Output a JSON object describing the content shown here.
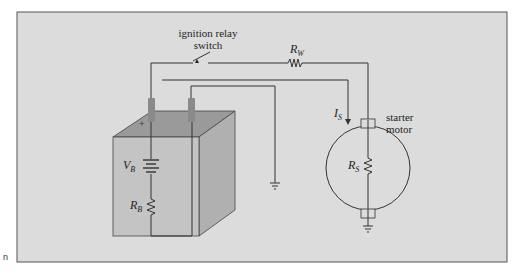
{
  "figure": {
    "background_color": "#dcdcdc",
    "frame_color": "#555555",
    "wire_color": "#333333",
    "battery_top_color": "#9a9a9a",
    "battery_front_color": "#c4c4c4",
    "battery_side_color": "#b0b0b0",
    "terminal_color": "#8a8a8a"
  },
  "labels": {
    "switch_line1": "ignition relay",
    "switch_line2": "switch",
    "rw_main": "R",
    "rw_sub": "W",
    "is_main": "I",
    "is_sub": "S",
    "motor_line1": "starter",
    "motor_line2": "motor",
    "rs_main": "R",
    "rs_sub": "S",
    "vb_main": "V",
    "vb_sub": "B",
    "rb_main": "R",
    "rb_sub": "B",
    "plus_sign": "+"
  },
  "margin": {
    "left_mark": "n"
  }
}
